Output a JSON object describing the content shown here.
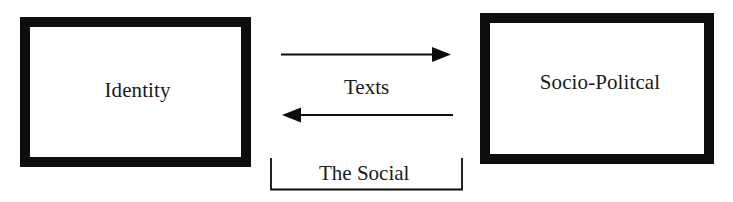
{
  "diagram": {
    "nodes": [
      {
        "id": "identity",
        "label": "Identity"
      },
      {
        "id": "socio-political",
        "label": "Socio-Politcal"
      }
    ],
    "edges": [
      {
        "from": "identity",
        "to": "socio-political",
        "direction": "right"
      },
      {
        "from": "socio-political",
        "to": "identity",
        "direction": "left"
      }
    ],
    "edge_label": "Texts",
    "bracket_label": "The Social"
  },
  "colors": {
    "stroke": "#0d0d0d",
    "text": "#1a1a1a",
    "background": "#ffffff"
  }
}
